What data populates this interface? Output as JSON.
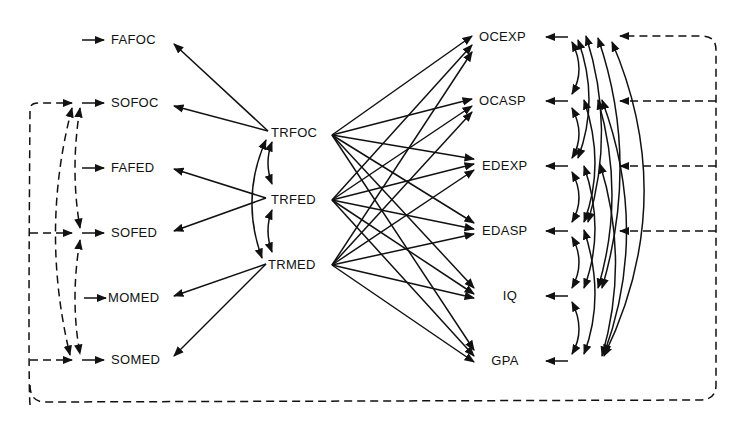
{
  "diagram": {
    "type": "path-model",
    "colors": {
      "ink": "#111111",
      "background": "#ffffff"
    },
    "exogenous": [
      {
        "id": "FAFOC",
        "label": "FAFOC"
      },
      {
        "id": "SOFOC",
        "label": "SOFOC"
      },
      {
        "id": "FAFED",
        "label": "FAFED"
      },
      {
        "id": "SOFED",
        "label": "SOFED"
      },
      {
        "id": "MOMED",
        "label": "MOMED"
      },
      {
        "id": "SOMED",
        "label": "SOMED"
      }
    ],
    "traits": [
      {
        "id": "TRFOC",
        "label": "TRFOC"
      },
      {
        "id": "TRFED",
        "label": "TRFED"
      },
      {
        "id": "TRMED",
        "label": "TRMED"
      }
    ],
    "outcomes": [
      {
        "id": "OCEXP",
        "label": "OCEXP"
      },
      {
        "id": "OCASP",
        "label": "OCASP"
      },
      {
        "id": "EDEXP",
        "label": "EDEXP"
      },
      {
        "id": "EDASP",
        "label": "EDASP"
      },
      {
        "id": "IQ",
        "label": "IQ"
      },
      {
        "id": "GPA",
        "label": "GPA"
      }
    ],
    "edges": {
      "trait_to_indicator": [
        [
          "TRFOC",
          "FAFOC"
        ],
        [
          "TRFOC",
          "SOFOC"
        ],
        [
          "TRFED",
          "FAFED"
        ],
        [
          "TRFED",
          "SOFED"
        ],
        [
          "TRMED",
          "MOMED"
        ],
        [
          "TRMED",
          "SOMED"
        ]
      ],
      "trait_to_outcome": "all traits to all outcomes",
      "trait_correlations": [
        [
          "TRFOC",
          "TRFED"
        ],
        [
          "TRFED",
          "TRMED"
        ],
        [
          "TRFOC",
          "TRMED"
        ]
      ],
      "outcome_correlations": "all outcome pairs (curved double-headed)",
      "correlated_errors_dashed": [
        [
          "SOFOC",
          "SOFED"
        ],
        [
          "SOFOC",
          "SOMED"
        ],
        [
          "SOFED",
          "SOMED"
        ],
        [
          "OCEXP",
          "OCASP",
          "EDEXP",
          "EDASP",
          "SOFOC",
          "SOFED",
          "SOMED"
        ]
      ]
    }
  }
}
